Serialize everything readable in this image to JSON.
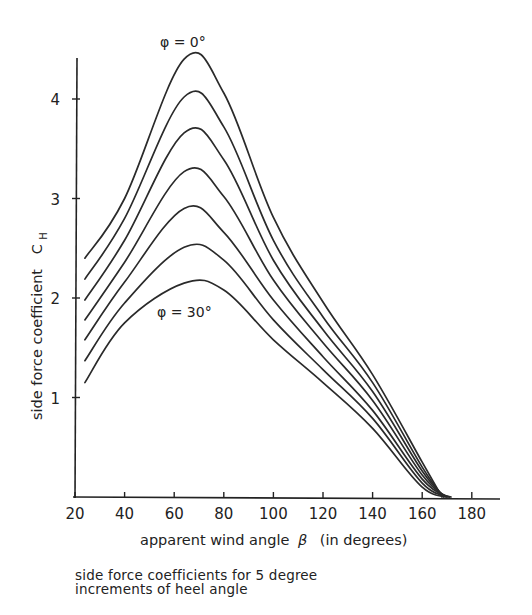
{
  "chart_data": {
    "type": "line",
    "title": "",
    "caption": "side force coefficients for 5 degree\nincrements of heel angle",
    "xlabel": "apparent wind angle β (in degrees)",
    "ylabel": "side force coefficient  C_H",
    "xlim": [
      20,
      190
    ],
    "ylim": [
      0,
      4.6
    ],
    "x_ticks": [
      20,
      40,
      60,
      80,
      100,
      120,
      140,
      160,
      180
    ],
    "y_ticks": [
      1,
      2,
      3,
      4
    ],
    "grid": false,
    "legend": "none",
    "annotations": [
      {
        "text": "φ = 0°",
        "refers_to": "top curve"
      },
      {
        "text": "φ = 30°",
        "refers_to": "bottom curve"
      }
    ],
    "x": [
      24,
      40,
      64,
      80,
      100,
      120,
      140,
      160,
      172
    ],
    "series": [
      {
        "name": "φ = 0°",
        "values": [
          2.4,
          3.0,
          4.4,
          4.06,
          2.81,
          1.96,
          1.23,
          0.35,
          0.0
        ]
      },
      {
        "name": "φ = 5°",
        "values": [
          2.19,
          2.8,
          4.02,
          3.72,
          2.58,
          1.81,
          1.15,
          0.3,
          0.0
        ]
      },
      {
        "name": "φ = 10°",
        "values": [
          1.98,
          2.58,
          3.66,
          3.39,
          2.38,
          1.68,
          1.06,
          0.26,
          0.0
        ]
      },
      {
        "name": "φ = 15°",
        "values": [
          1.78,
          2.36,
          3.27,
          3.02,
          2.18,
          1.55,
          0.97,
          0.22,
          0.0
        ]
      },
      {
        "name": "φ = 20°",
        "values": [
          1.58,
          2.16,
          2.9,
          2.66,
          1.98,
          1.41,
          0.87,
          0.18,
          0.0
        ]
      },
      {
        "name": "φ = 25°",
        "values": [
          1.37,
          1.95,
          2.51,
          2.38,
          1.78,
          1.28,
          0.79,
          0.14,
          0.0
        ]
      },
      {
        "name": "φ = 30°",
        "values": [
          1.15,
          1.75,
          2.15,
          2.08,
          1.58,
          1.15,
          0.69,
          0.1,
          0.0
        ]
      }
    ]
  },
  "labels": {
    "xlabel": "apparent wind angle",
    "xlabel_symbol": "β",
    "xlabel_units": "(in degrees)",
    "ylabel": "side force coefficient",
    "ylabel_symbol": "C",
    "ylabel_sub": "H",
    "annot_top": "φ = 0°",
    "annot_bottom": "φ = 30°",
    "caption": "side force coefficients for 5 degree\nincrements of heel angle"
  },
  "style": {
    "line_color": "#2a2a2a",
    "axis_color": "#222222",
    "background": "#ffffff"
  }
}
